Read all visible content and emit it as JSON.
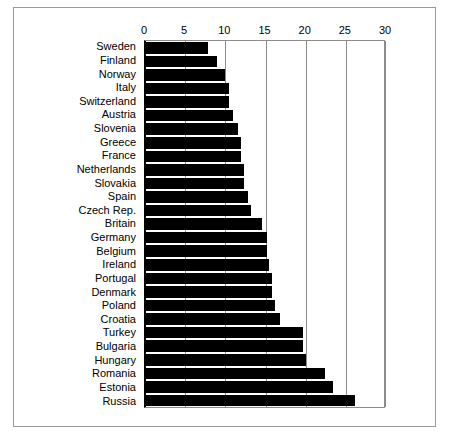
{
  "chart_data": {
    "type": "bar",
    "orientation": "horizontal",
    "title": "",
    "subtitle": "",
    "xlabel": "",
    "ylabel": "",
    "xlim": [
      0,
      30
    ],
    "ylim": null,
    "grid": true,
    "legend": null,
    "legend_position": "none",
    "xticks": [
      "0",
      "5",
      "10",
      "15",
      "20",
      "25",
      "30"
    ],
    "xtick_values": [
      0,
      5,
      10,
      15,
      20,
      25,
      30
    ],
    "categories": [
      "Sweden",
      "Finland",
      "Norway",
      "Italy",
      "Switzerland",
      "Austria",
      "Slovenia",
      "Greece",
      "France",
      "Netherlands",
      "Slovakia",
      "Spain",
      "Czech Rep.",
      "Britain",
      "Germany",
      "Belgium",
      "Ireland",
      "Portugal",
      "Denmark",
      "Poland",
      "Croatia",
      "Turkey",
      "Bulgaria",
      "Hungary",
      "Romania",
      "Estonia",
      "Russia"
    ],
    "values": [
      7.8,
      9.0,
      10.0,
      10.5,
      10.5,
      11.0,
      11.6,
      12.0,
      12.0,
      12.3,
      12.3,
      12.8,
      13.2,
      14.6,
      15.2,
      15.2,
      15.4,
      15.8,
      15.8,
      16.2,
      16.8,
      19.7,
      19.7,
      20.0,
      22.4,
      23.4,
      26.1
    ],
    "bar_color": "#000000",
    "axis_color": "#8c8c8c",
    "zero_axis_color": "#000000",
    "background_color": "#ffffff",
    "frame_color": "#9a9a9a"
  }
}
